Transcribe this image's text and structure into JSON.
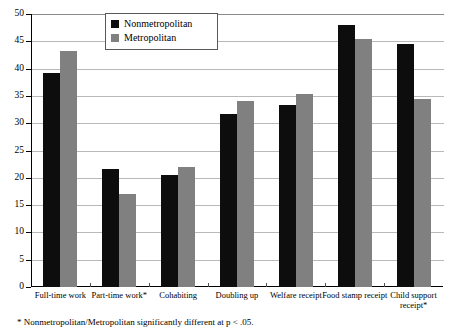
{
  "chart_data": {
    "type": "bar",
    "title": "",
    "xlabel": "",
    "ylabel": "",
    "ylim": [
      0,
      50
    ],
    "ytick_step": 5,
    "yticks": [
      0,
      5,
      10,
      15,
      20,
      25,
      30,
      35,
      40,
      45,
      50
    ],
    "ytick_labels": [
      "0",
      "5",
      "10",
      "15",
      "20",
      "25",
      "30",
      "35",
      "40",
      "45",
      "50"
    ],
    "grid": true,
    "legend_position": "top-center",
    "categories": [
      "Full-time work",
      "Part-time work*",
      "Cohabiting",
      "Doubling up",
      "Welfare receipt",
      "Food stamp receipt",
      "Child support receipt*"
    ],
    "series": [
      {
        "name": "Nonmetropolitan",
        "color": "#0d0d0d",
        "values": [
          39.2,
          21.6,
          20.5,
          31.6,
          33.3,
          48.0,
          44.5
        ]
      },
      {
        "name": "Metropolitan",
        "color": "#808080",
        "values": [
          43.3,
          17.0,
          22.0,
          34.0,
          35.4,
          45.4,
          34.4
        ]
      }
    ],
    "annotations": [
      "* Nonmetropolitan/Metropolitan significantly different at p < .05."
    ]
  },
  "legend": {
    "items": [
      {
        "label": "Nonmetropolitan",
        "color": "#0d0d0d"
      },
      {
        "label": "Metropolitan",
        "color": "#808080"
      }
    ]
  },
  "footnote": {
    "text": "* Nonmetropolitan/Metropolitan significantly different at p < .05."
  },
  "colors": {
    "nonmetropolitan": "#0d0d0d",
    "metropolitan": "#808080",
    "axis": "#000000",
    "gridline": "#b9b9b9",
    "background": "#ffffff"
  }
}
